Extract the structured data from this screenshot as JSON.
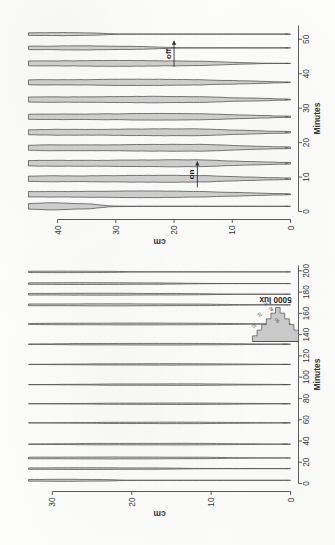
{
  "figure": {
    "caption_none": "",
    "background_hex": "#fdfdfc",
    "violin_fill_hex": "#c9c9c9",
    "violin_stroke_hex": "#4f4f4f"
  },
  "panels": {
    "upper": {
      "x_axis_title": "Minutes",
      "x_ticks": [
        "0",
        "20",
        "40",
        "60",
        "80",
        "100",
        "120",
        "140",
        "160",
        "180",
        "200"
      ],
      "y_axis_title": "cm",
      "y_ticks": [
        "0",
        "10",
        "20",
        "30"
      ],
      "group_labels": [
        "0",
        "40",
        "300",
        "1400",
        "3100",
        "5000 lux",
        "3100",
        "1400",
        "300",
        "30",
        "0"
      ]
    },
    "lower": {
      "x_axis_title": "Minutes",
      "x_ticks": [
        "0",
        "10",
        "20",
        "30",
        "40",
        "50"
      ],
      "y_axis_title": "cm",
      "y_ticks": [
        "0",
        "10",
        "20",
        "30",
        "40"
      ],
      "annotation_on": "on",
      "annotation_off": "off"
    }
  },
  "inset": {
    "label": "5000 lux",
    "tick_labels": [
      "10",
      "20",
      "30",
      "40",
      "50"
    ]
  },
  "chart_data": {
    "type": "area",
    "title": "",
    "xlabel": "Minutes",
    "ylabel": "cm",
    "grid": false,
    "legend": "none",
    "panels": [
      {
        "name": "upper-panel",
        "xlim": [
          0,
          205
        ],
        "ylim": [
          0,
          33
        ],
        "xlabel": "Minutes",
        "ylabel": "cm",
        "xticks": [
          0,
          20,
          40,
          60,
          80,
          100,
          120,
          140,
          160,
          180,
          200
        ],
        "yticks": [
          0,
          10,
          20,
          30
        ],
        "violins": [
          {
            "center": 3,
            "lux_label": "0",
            "mean_cm": 28.5,
            "spread_cm": 4.0,
            "peak_width": 0.95,
            "tail_to_cm": 0.5
          },
          {
            "center": 14,
            "lux_label": "40",
            "mean_cm": 26.0,
            "spread_cm": 7.5,
            "peak_width": 0.8,
            "tail_to_cm": 0.5
          },
          {
            "center": 24,
            "lux_label": "300",
            "mean_cm": 22.0,
            "spread_cm": 9.0,
            "peak_width": 0.9,
            "tail_to_cm": 0.5
          },
          {
            "center": 37,
            "lux_label": "1400",
            "mean_cm": 15.5,
            "spread_cm": 8.0,
            "peak_width": 0.75,
            "tail_to_cm": 1.0
          },
          {
            "center": 57,
            "lux_label": "3100",
            "mean_cm": 14.0,
            "spread_cm": 7.0,
            "peak_width": 0.7,
            "tail_to_cm": 1.0
          },
          {
            "center": 75,
            "lux_label": "",
            "mean_cm": 13.5,
            "spread_cm": 7.0,
            "peak_width": 0.7,
            "tail_to_cm": 1.0
          },
          {
            "center": 93,
            "lux_label": "5000 lux",
            "mean_cm": 13.0,
            "spread_cm": 7.5,
            "peak_width": 0.72,
            "tail_to_cm": 1.0
          },
          {
            "center": 112,
            "lux_label": "",
            "mean_cm": 15.0,
            "spread_cm": 7.0,
            "peak_width": 0.68,
            "tail_to_cm": 1.0
          },
          {
            "center": 131,
            "lux_label": "",
            "mean_cm": 16.5,
            "spread_cm": 8.0,
            "peak_width": 0.78,
            "tail_to_cm": 1.0
          },
          {
            "center": 150,
            "lux_label": "3100",
            "mean_cm": 19.0,
            "spread_cm": 8.5,
            "peak_width": 0.85,
            "tail_to_cm": 1.0
          },
          {
            "center": 168,
            "lux_label": "1400",
            "mean_cm": 22.5,
            "spread_cm": 9.5,
            "peak_width": 0.95,
            "tail_to_cm": 0.5
          },
          {
            "center": 178,
            "lux_label": "300",
            "mean_cm": 24.5,
            "spread_cm": 9.0,
            "peak_width": 0.88,
            "tail_to_cm": 0.5
          },
          {
            "center": 188,
            "lux_label": "30",
            "mean_cm": 26.5,
            "spread_cm": 8.0,
            "peak_width": 0.85,
            "tail_to_cm": 0.5
          },
          {
            "center": 199,
            "lux_label": "0",
            "mean_cm": 29.0,
            "spread_cm": 5.0,
            "peak_width": 0.7,
            "tail_to_cm": 0.5
          }
        ]
      },
      {
        "name": "lower-panel",
        "xlim": [
          0,
          54
        ],
        "ylim": [
          0,
          45
        ],
        "xlabel": "Minutes",
        "ylabel": "cm",
        "xticks": [
          0,
          10,
          20,
          30,
          40,
          50
        ],
        "yticks": [
          0,
          10,
          20,
          30,
          40
        ],
        "annotations": [
          {
            "text": "on",
            "x": 7,
            "y": 16,
            "arrow": "right"
          },
          {
            "text": "off",
            "x": 42,
            "y": 20,
            "arrow": "right"
          }
        ],
        "violins": [
          {
            "center": 1.5,
            "mean_cm": 41.0,
            "spread_cm": 5.0,
            "peak_width": 1.0,
            "tail_to_cm": 1.0
          },
          {
            "center": 5.0,
            "mean_cm": 26.0,
            "spread_cm": 16.0,
            "peak_width": 0.95,
            "tail_to_cm": 1.0
          },
          {
            "center": 9.5,
            "mean_cm": 22.0,
            "spread_cm": 18.0,
            "peak_width": 1.0,
            "tail_to_cm": 1.0
          },
          {
            "center": 14.0,
            "mean_cm": 20.0,
            "spread_cm": 19.0,
            "peak_width": 1.0,
            "tail_to_cm": 1.0
          },
          {
            "center": 18.5,
            "mean_cm": 19.0,
            "spread_cm": 19.0,
            "peak_width": 1.0,
            "tail_to_cm": 1.0
          },
          {
            "center": 23.0,
            "mean_cm": 20.0,
            "spread_cm": 18.0,
            "peak_width": 1.0,
            "tail_to_cm": 1.0
          },
          {
            "center": 27.5,
            "mean_cm": 22.0,
            "spread_cm": 17.0,
            "peak_width": 0.95,
            "tail_to_cm": 1.0
          },
          {
            "center": 32.5,
            "mean_cm": 24.0,
            "spread_cm": 16.0,
            "peak_width": 0.92,
            "tail_to_cm": 1.0
          },
          {
            "center": 37.5,
            "mean_cm": 26.0,
            "spread_cm": 15.0,
            "peak_width": 0.9,
            "tail_to_cm": 1.0
          },
          {
            "center": 43.0,
            "mean_cm": 30.0,
            "spread_cm": 13.0,
            "peak_width": 0.85,
            "tail_to_cm": 1.0
          },
          {
            "center": 47.5,
            "mean_cm": 36.0,
            "spread_cm": 8.0,
            "peak_width": 0.6,
            "tail_to_cm": 1.0
          },
          {
            "center": 51.5,
            "mean_cm": 40.0,
            "spread_cm": 5.0,
            "peak_width": 0.45,
            "tail_to_cm": 1.0
          }
        ]
      }
    ],
    "inset": {
      "type": "bar",
      "label": "5000 lux",
      "tick_labels": [
        "10",
        "20",
        "30",
        "40",
        "50"
      ],
      "values": [
        2,
        4,
        6,
        8,
        10,
        12,
        10,
        8,
        6,
        4
      ]
    }
  }
}
